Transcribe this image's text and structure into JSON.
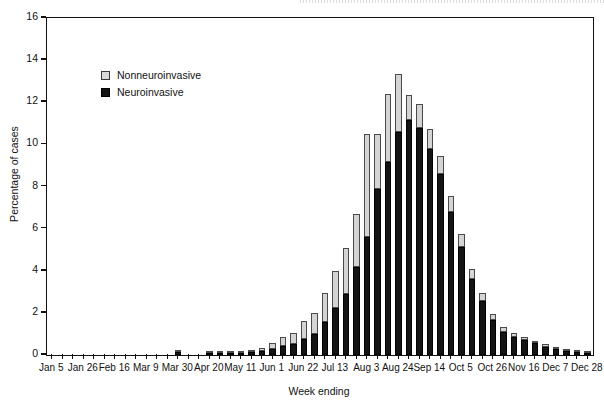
{
  "chart_data": {
    "type": "bar",
    "stacked": true,
    "title": "",
    "xlabel": "Week ending",
    "ylabel": "Percentage of cases",
    "ylim": [
      0,
      16
    ],
    "ytick_labels": [
      "0",
      "2",
      "4",
      "6",
      "8",
      "10",
      "12",
      "14",
      "16"
    ],
    "ytick_values": [
      0,
      2,
      4,
      6,
      8,
      10,
      12,
      14,
      16
    ],
    "grid": false,
    "legend_position": "upper-left-inside",
    "legend": [
      "Nonneuroinvasive",
      "Neuroinvasive"
    ],
    "colors": {
      "nonneuroinvasive": "#d4d4d4",
      "neuroinvasive": "#141414",
      "axis": "#111111",
      "background": "#ffffff"
    },
    "xtick_labels": [
      "Jan 5",
      "Jan 26",
      "Feb 16",
      "Mar 9",
      "Mar 30",
      "Apr 20",
      "May 11",
      "Jun 1",
      "Jun 22",
      "Jul 13",
      "Aug 3",
      "Aug 24",
      "Sep 14",
      "Oct 5",
      "Oct 26",
      "Nov 16",
      "Dec 7",
      "Dec 28"
    ],
    "xtick_label_every": 3,
    "categories": [
      "Jan 5",
      "Jan 12",
      "Jan 19",
      "Jan 26",
      "Feb 2",
      "Feb 9",
      "Feb 16",
      "Feb 23",
      "Mar 2",
      "Mar 9",
      "Mar 16",
      "Mar 23",
      "Mar 30",
      "Apr 6",
      "Apr 13",
      "Apr 20",
      "Apr 27",
      "May 4",
      "May 11",
      "May 18",
      "May 25",
      "Jun 1",
      "Jun 8",
      "Jun 15",
      "Jun 22",
      "Jun 29",
      "Jul 6",
      "Jul 13",
      "Jul 20",
      "Jul 27",
      "Aug 3",
      "Aug 10",
      "Aug 17",
      "Aug 24",
      "Aug 31",
      "Sep 7",
      "Sep 14",
      "Sep 21",
      "Sep 28",
      "Oct 5",
      "Oct 12",
      "Oct 19",
      "Oct 26",
      "Nov 2",
      "Nov 9",
      "Nov 16",
      "Nov 23",
      "Nov 30",
      "Dec 7",
      "Dec 14",
      "Dec 21",
      "Dec 28"
    ],
    "series": [
      {
        "name": "Neuroinvasive",
        "values": [
          0,
          0,
          0,
          0,
          0,
          0,
          0,
          0,
          0,
          0,
          0,
          0,
          0.15,
          0,
          0,
          0.1,
          0.1,
          0.1,
          0.1,
          0.15,
          0.2,
          0.3,
          0.45,
          0.5,
          0.75,
          1.0,
          1.55,
          2.25,
          2.9,
          4.2,
          5.6,
          7.9,
          9.15,
          10.6,
          11.15,
          10.8,
          9.8,
          8.6,
          6.8,
          5.15,
          3.6,
          2.55,
          1.65,
          1.1,
          0.85,
          0.7,
          0.55,
          0.4,
          0.3,
          0.2,
          0.15,
          0.1
        ]
      },
      {
        "name": "Nonneuroinvasive",
        "values": [
          0,
          0,
          0,
          0,
          0,
          0,
          0,
          0,
          0,
          0,
          0,
          0,
          0.05,
          0,
          0,
          0.05,
          0.05,
          0.05,
          0.05,
          0.1,
          0.15,
          0.25,
          0.4,
          0.55,
          0.85,
          1.0,
          1.4,
          1.75,
          2.2,
          2.5,
          4.9,
          2.6,
          3.25,
          2.75,
          1.2,
          1.1,
          0.95,
          0.85,
          0.75,
          0.6,
          0.5,
          0.4,
          0.3,
          0.25,
          0.2,
          0.15,
          0.1,
          0.1,
          0.08,
          0.05,
          0.05,
          0.05
        ]
      }
    ],
    "totals": [
      0,
      0,
      0,
      0,
      0,
      0,
      0,
      0,
      0,
      0,
      0,
      0,
      0.2,
      0,
      0,
      0.15,
      0.15,
      0.15,
      0.15,
      0.25,
      0.35,
      0.55,
      0.85,
      1.05,
      1.6,
      2.0,
      2.95,
      4.0,
      5.1,
      6.7,
      10.5,
      10.5,
      12.4,
      13.35,
      12.35,
      11.9,
      10.75,
      9.45,
      7.55,
      5.75,
      4.1,
      2.95,
      1.95,
      1.35,
      1.05,
      0.85,
      0.65,
      0.5,
      0.38,
      0.25,
      0.2,
      0.15
    ],
    "peak": {
      "category": "Aug 24",
      "total": 13.35
    }
  },
  "axes": {
    "y_title": "Percentage of cases",
    "x_title": "Week ending"
  },
  "legend": {
    "items": [
      {
        "label": "Nonneuroinvasive",
        "key": "nonneuroinvasive"
      },
      {
        "label": "Neuroinvasive",
        "key": "neuroinvasive"
      }
    ]
  }
}
